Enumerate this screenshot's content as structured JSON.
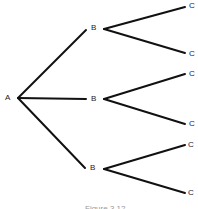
{
  "diagram": {
    "type": "tree",
    "root": {
      "label": "A"
    },
    "level1": [
      {
        "label": "B"
      },
      {
        "label": "B"
      },
      {
        "label": "B"
      }
    ],
    "level2": [
      {
        "label": "C"
      },
      {
        "label": "C"
      },
      {
        "label": "C"
      },
      {
        "label": "C"
      },
      {
        "label": "C"
      },
      {
        "label": "C"
      }
    ],
    "caption": "Figure 3.12"
  }
}
